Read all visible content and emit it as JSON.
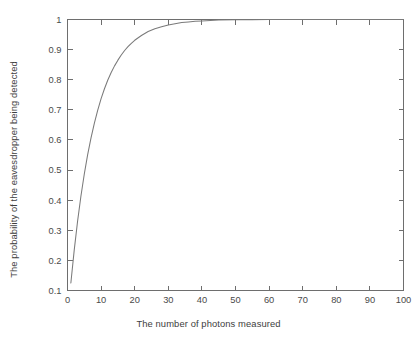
{
  "chart_data": {
    "type": "line",
    "title": "",
    "xlabel": "The number of photons measured",
    "ylabel": "The probability of the eavesdropper being detected",
    "xlim": [
      0,
      100
    ],
    "ylim": [
      0.1,
      1
    ],
    "grid": false,
    "legend": null,
    "xticks": [
      0,
      10,
      20,
      30,
      40,
      50,
      60,
      70,
      80,
      90,
      100
    ],
    "xtick_labels": [
      "0",
      "10",
      "20",
      "30",
      "40",
      "50",
      "60",
      "70",
      "80",
      "90",
      "100"
    ],
    "yticks": [
      0.1,
      0.2,
      0.3,
      0.4,
      0.5,
      0.6,
      0.7,
      0.8,
      0.9,
      1
    ],
    "ytick_labels": [
      "0.1",
      "0.2",
      "0.3",
      "0.4",
      "0.5",
      "0.6",
      "0.7",
      "0.8",
      "0.9",
      "1"
    ],
    "series": [
      {
        "name": "detection probability",
        "color": "#7a7a7a",
        "x": [
          1,
          2,
          3,
          4,
          5,
          6,
          7,
          8,
          9,
          10,
          11,
          12,
          13,
          14,
          15,
          16,
          17,
          18,
          19,
          20,
          22,
          24,
          26,
          28,
          30,
          32,
          34,
          36,
          38,
          40,
          45,
          50,
          55,
          60,
          65,
          70,
          75,
          80,
          85,
          90,
          95,
          100
        ],
        "values": [
          0.125,
          0.234,
          0.33,
          0.414,
          0.487,
          0.551,
          0.607,
          0.656,
          0.699,
          0.737,
          0.77,
          0.799,
          0.824,
          0.846,
          0.865,
          0.882,
          0.897,
          0.91,
          0.921,
          0.931,
          0.947,
          0.96,
          0.969,
          0.976,
          0.982,
          0.986,
          0.99,
          0.992,
          0.994,
          0.995,
          0.998,
          0.999,
          0.999,
          1.0,
          1.0,
          1.0,
          1.0,
          1.0,
          1.0,
          1.0,
          1.0,
          1.0
        ]
      }
    ],
    "formula_note": "P = 1 - (7/8)^n style decay approaching 1"
  },
  "axes": {
    "frame_color": "#6e6e6e",
    "background": "#ffffff"
  }
}
